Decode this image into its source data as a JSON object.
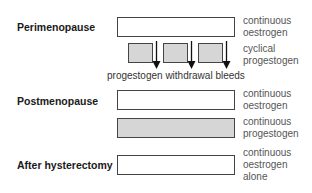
{
  "stages": {
    "perimenopause": "Perimenopause",
    "postmenopause": "Postmenopause",
    "hysterectomy": "After hysterectomy"
  },
  "notes": {
    "peri_oestrogen": "continuous\noestrogen",
    "peri_progestogen": "cyclical\nprogestogen",
    "post_oestrogen": "continuous\noestrogen",
    "post_progestogen": "continuous\nprogestogen",
    "hyst_oestrogen": "continuous\noestrogen\nalone"
  },
  "withdrawal_label": "progestogen withdrawal bleeds",
  "colors": {
    "oestrogen_fill": "#ffffff",
    "progestogen_fill": "#d6d6d6",
    "outline": "#444444"
  }
}
